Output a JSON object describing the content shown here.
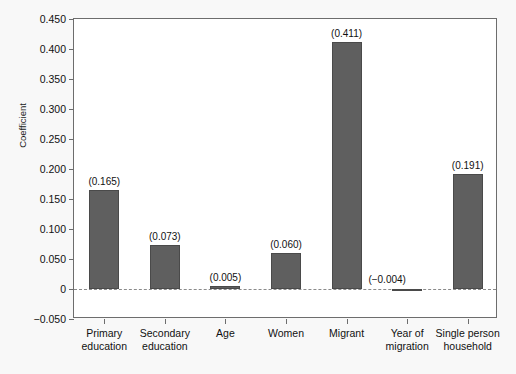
{
  "figure": {
    "caption_fragment": "",
    "background_color": "#f8f8f8",
    "plot_background_color": "#ffffff",
    "bar_color": "#5f5f5f",
    "axis_color": "#6d6d6d",
    "zero_line_color": "#8a8a8a"
  },
  "chart_data": {
    "type": "bar",
    "title": "",
    "xlabel": "",
    "ylabel": "Coefficient",
    "categories": [
      "Primary education",
      "Secondary education",
      "Age",
      "Women",
      "Migrant",
      "Year of migration",
      "Single person household"
    ],
    "values": [
      0.165,
      0.073,
      0.005,
      0.06,
      0.411,
      -0.004,
      0.191
    ],
    "value_labels": [
      "(0.165)",
      "(0.073)",
      "(0.005)",
      "(0.060)",
      "(0.411)",
      "(−0.004)",
      "(0.191)"
    ],
    "ylim": [
      -0.05,
      0.45
    ],
    "ytick_values": [
      0.45,
      0.4,
      0.35,
      0.3,
      0.25,
      0.2,
      0.15,
      0.1,
      0.05,
      0,
      -0.05
    ],
    "ytick_labels": [
      "0.450",
      "0.400",
      "0.350",
      "0.300",
      "0.250",
      "0.200",
      "0.150",
      "0.100",
      "0.050",
      "0",
      "−0.050"
    ],
    "grid": false,
    "legend": false,
    "zero_reference_line": true
  }
}
